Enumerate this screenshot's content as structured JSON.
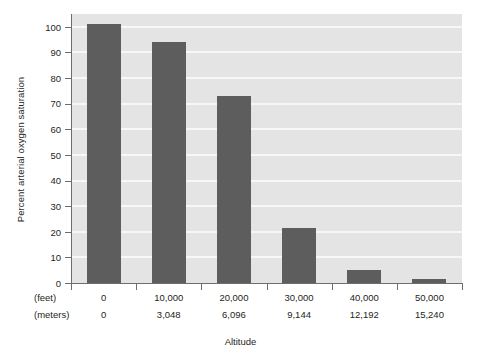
{
  "chart_data": {
    "type": "bar",
    "title": "",
    "xlabel": "Altitude",
    "ylabel": "Percent arterial oxygen saturation",
    "categories": [
      "0",
      "10,000",
      "20,000",
      "30,000",
      "40,000",
      "50,000"
    ],
    "categories_secondary": [
      "0",
      "3,048",
      "6,096",
      "9,144",
      "12,192",
      "15,240"
    ],
    "category_unit_primary": "(feet)",
    "category_unit_secondary": "(meters)",
    "values": [
      101,
      94,
      73,
      21.5,
      5,
      1.5
    ],
    "ylim": [
      0,
      105
    ],
    "yticks": [
      0,
      10,
      20,
      30,
      40,
      50,
      60,
      70,
      80,
      90,
      100
    ],
    "ytick_labels": [
      "0",
      "10",
      "20",
      "30",
      "40",
      "50",
      "60",
      "70",
      "80",
      "90",
      "100"
    ],
    "grid": true,
    "grid_axis": "y",
    "legend": "none",
    "colors": {
      "bar": "#5d5d5d",
      "plot_background": "#e4e4e4",
      "gridline": "#f7f7f7",
      "axis": "#6d6d6d",
      "text": "#231f20",
      "figure_background": "#ffffff"
    }
  }
}
